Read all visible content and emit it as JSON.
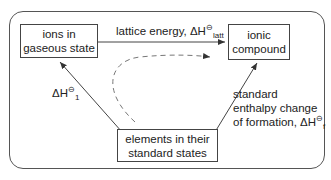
{
  "diagram": {
    "nodes": {
      "ions_gaseous": {
        "line1": "ions in",
        "line2": "gaseous state"
      },
      "ionic_compound": {
        "line1": "ionic",
        "line2": "compound"
      },
      "elements": {
        "line1": "elements in their",
        "line2": "standard states"
      }
    },
    "edges": {
      "lattice": {
        "text": "lattice energy, ΔH",
        "sup": "⊖",
        "sub": "latt"
      },
      "delta_h1": {
        "text": "ΔH",
        "sup": "⊖",
        "sub": "1"
      },
      "formation": {
        "line1": "standard",
        "line2": "enthalpy change",
        "line3": "of formation, ΔH",
        "sup": "⊖",
        "sub": "f"
      }
    },
    "colors": {
      "line": "#444444",
      "dashed": "#666666"
    }
  }
}
